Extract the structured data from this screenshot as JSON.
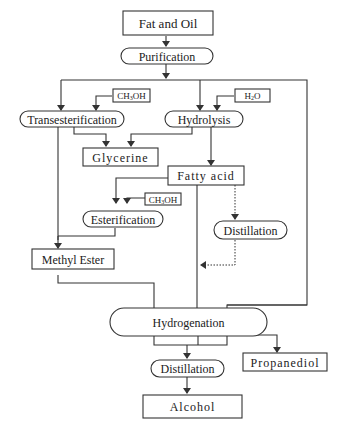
{
  "diagram": {
    "type": "process-flowchart",
    "nodes": {
      "fat_and_oil": "Fat and Oil",
      "purification": "Purification",
      "transesterification": "Transesterification",
      "methanol_1": "CH3OH",
      "hydrolysis": "Hydrolysis",
      "water": "H2O",
      "glycerine": "Glycerine",
      "fatty_acid": "Fatty acid",
      "methanol_2": "CH3OH",
      "esterification": "Esterification",
      "distillation_1": "Distillation",
      "methyl_ester": "Methyl Ester",
      "hydrogenation": "Hydrogenation",
      "distillation_2": "Distillation",
      "propanediol": "Propanediol",
      "alcohol": "Alcohol"
    },
    "chem": {
      "ch3oh_prefix": "CH",
      "ch3oh_sub": "3",
      "ch3oh_suffix": "OH",
      "h2o_prefix": "H",
      "h2o_sub": "2",
      "h2o_suffix": "O"
    },
    "edges": [
      {
        "from": "Fat and Oil",
        "to": "Purification",
        "style": "solid"
      },
      {
        "from": "Purification",
        "to": "Transesterification",
        "style": "solid"
      },
      {
        "from": "Purification",
        "to": "Hydrolysis",
        "style": "solid"
      },
      {
        "from": "Purification",
        "to": "Hydrogenation",
        "style": "solid"
      },
      {
        "from": "CH3OH",
        "to": "Transesterification",
        "style": "solid"
      },
      {
        "from": "H2O",
        "to": "Hydrolysis",
        "style": "solid"
      },
      {
        "from": "Transesterification",
        "to": "Glycerine",
        "style": "solid"
      },
      {
        "from": "Hydrolysis",
        "to": "Glycerine",
        "style": "solid"
      },
      {
        "from": "Transesterification",
        "to": "Methyl Ester",
        "style": "solid"
      },
      {
        "from": "Hydrolysis",
        "to": "Fatty acid",
        "style": "solid"
      },
      {
        "from": "Fatty acid",
        "to": "Esterification",
        "style": "solid"
      },
      {
        "from": "CH3OH",
        "to": "Esterification",
        "style": "solid"
      },
      {
        "from": "Esterification",
        "to": "Methyl Ester",
        "style": "solid"
      },
      {
        "from": "Fatty acid",
        "to": "Distillation",
        "style": "dotted"
      },
      {
        "from": "Distillation",
        "to": "Fatty acid line",
        "style": "dotted"
      },
      {
        "from": "Fatty acid",
        "to": "Hydrogenation",
        "style": "solid"
      },
      {
        "from": "Methyl Ester",
        "to": "Hydrogenation",
        "style": "solid"
      },
      {
        "from": "Hydrogenation",
        "to": "Distillation",
        "style": "solid"
      },
      {
        "from": "Hydrogenation",
        "to": "Propanediol",
        "style": "solid"
      },
      {
        "from": "Distillation",
        "to": "Alcohol",
        "style": "solid"
      }
    ]
  }
}
